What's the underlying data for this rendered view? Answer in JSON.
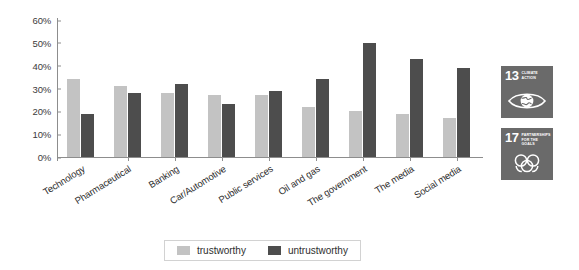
{
  "chart_data": {
    "type": "bar",
    "title": "",
    "xlabel": "",
    "ylabel": "",
    "ylim": [
      0,
      60
    ],
    "yticks": [
      "0%",
      "10%",
      "20%",
      "30%",
      "40%",
      "50%",
      "60%"
    ],
    "grid": false,
    "legend_position": "bottom",
    "categories": [
      "Technology",
      "Pharmaceutical",
      "Banking",
      "Car/Automotive",
      "Public services",
      "Oil and gas",
      "The government",
      "The media",
      "Social media"
    ],
    "series": [
      {
        "name": "trustworthy",
        "color": "#c3c3c3",
        "values": [
          34,
          31,
          28,
          27,
          27,
          22,
          20,
          19,
          17
        ]
      },
      {
        "name": "untrustworthy",
        "color": "#4d4d4d",
        "values": [
          19,
          28,
          32,
          23,
          29,
          34,
          50,
          43,
          39
        ]
      }
    ]
  },
  "legend": {
    "items": [
      {
        "label": "trustworthy",
        "swatch": "light"
      },
      {
        "label": "untrustworthy",
        "swatch": "dark"
      }
    ]
  },
  "sdg_badges": [
    {
      "number": "13",
      "line1": "CLIMATE",
      "line2": "ACTION",
      "icon": "eye-globe-icon",
      "color": "#6a6a6a"
    },
    {
      "number": "17",
      "line1": "PARTNERSHIPS",
      "line2": "FOR THE GOALS",
      "icon": "interlocking-circles-icon",
      "color": "#6a6a6a"
    }
  ]
}
